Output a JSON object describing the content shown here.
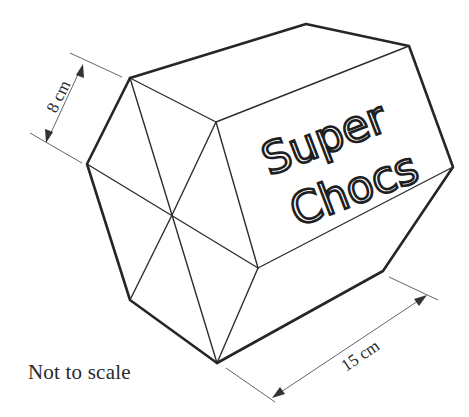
{
  "figure": {
    "label_brand": [
      "Super",
      "Chocs"
    ],
    "dimensions": {
      "hexagon_side": "8 cm",
      "prism_length": "15 cm"
    },
    "note": "Not to scale"
  },
  "colors": {
    "line": "#262626",
    "dimension_line": "#555555",
    "background": "#ffffff"
  }
}
